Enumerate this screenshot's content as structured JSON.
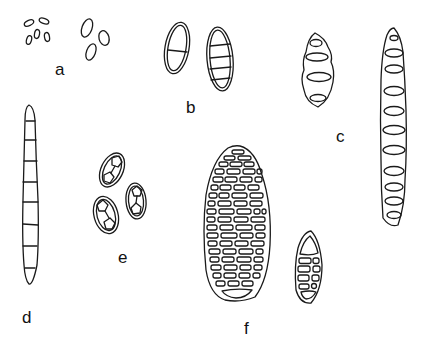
{
  "figure": {
    "type": "spore line drawings",
    "background": "#ffffff",
    "stroke_color": "#1a1a1a",
    "panels": [
      {
        "id": "a",
        "label": "a",
        "description": "small one-celled ellipsoid spores, two size groups"
      },
      {
        "id": "b",
        "label": "b",
        "description": "two-walled spores, one 1-septate and one 4-septate"
      },
      {
        "id": "c",
        "label": "c",
        "description": "phragmospores with lens-shaped locules, short and long forms"
      },
      {
        "id": "d",
        "label": "d",
        "description": "long narrow multi-septate spore"
      },
      {
        "id": "e",
        "label": "e",
        "description": "three ellipsoid spores with angular cells"
      },
      {
        "id": "f",
        "label": "f",
        "description": "muriform spores, one large and one small"
      }
    ]
  }
}
